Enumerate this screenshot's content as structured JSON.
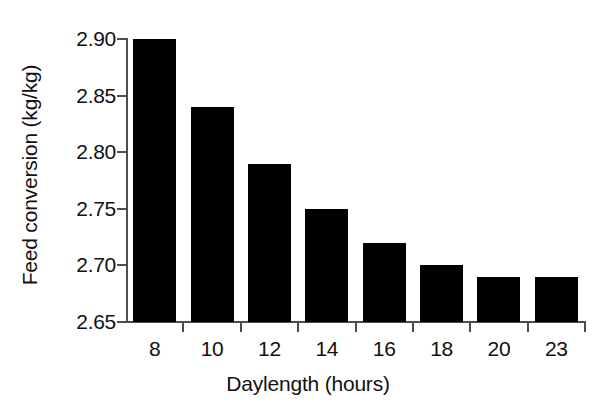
{
  "chart_data": {
    "type": "bar",
    "title": "",
    "subtitle": "",
    "xlabel": "Daylength (hours)",
    "ylabel": "Feed conversion (kg/kg)",
    "categories": [
      "8",
      "10",
      "12",
      "14",
      "16",
      "18",
      "20",
      "23"
    ],
    "values": [
      2.9,
      2.84,
      2.79,
      2.75,
      2.72,
      2.7,
      2.69,
      2.69
    ],
    "series": [
      {
        "name": "Feed conversion",
        "values": [
          2.9,
          2.84,
          2.79,
          2.75,
          2.72,
          2.7,
          2.69,
          2.69
        ]
      }
    ],
    "ylim": [
      2.65,
      2.9
    ],
    "ytick_values": [
      2.65,
      2.7,
      2.75,
      2.8,
      2.85,
      2.9
    ],
    "ytick_labels": [
      "2.65",
      "2.70",
      "2.75",
      "2.80",
      "2.85",
      "2.90"
    ],
    "xtick_labels": [
      "8",
      "10",
      "12",
      "14",
      "16",
      "18",
      "20",
      "23"
    ],
    "grid": false,
    "legend": false,
    "legend_position": "none",
    "bar_color": "#000000",
    "axis_color": "#4d4d4d",
    "background_color": "#ffffff",
    "annotations": []
  }
}
